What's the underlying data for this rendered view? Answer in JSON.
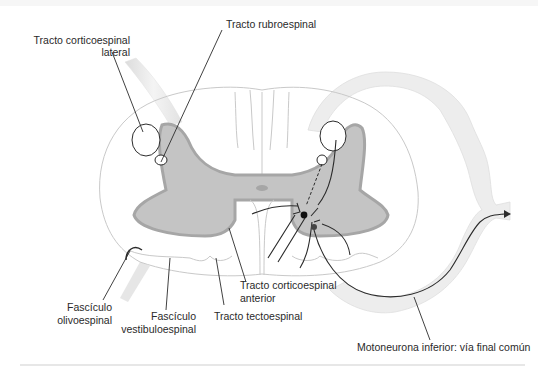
{
  "figure": {
    "type": "spinal-cord-cross-section",
    "labels": {
      "lateral_corticospinal": [
        "Tracto corticoespinal",
        "lateral"
      ],
      "rubrospinal": "Tracto rubroespinal",
      "olivospinal": [
        "Fascículo",
        "olivoespinal"
      ],
      "vestibulospinal": [
        "Fascículo",
        "vestibuloespinal"
      ],
      "anterior_corticospinal": [
        "Tracto corticoespinal",
        "anterior"
      ],
      "tectospinal": "Tracto tectoespinal",
      "lower_motor_neuron": "Motoneurona inferior: vía final común"
    },
    "colors": {
      "background": "#ffffff",
      "gray_matter_fill": "#c4c4c4",
      "gray_matter_border": "#a6a6a6",
      "white_matter_outline": "#c9c9c9",
      "nerve_root_fill": "#ececec",
      "line": "#2b2b2b",
      "rule": "#cfcfcf"
    }
  }
}
